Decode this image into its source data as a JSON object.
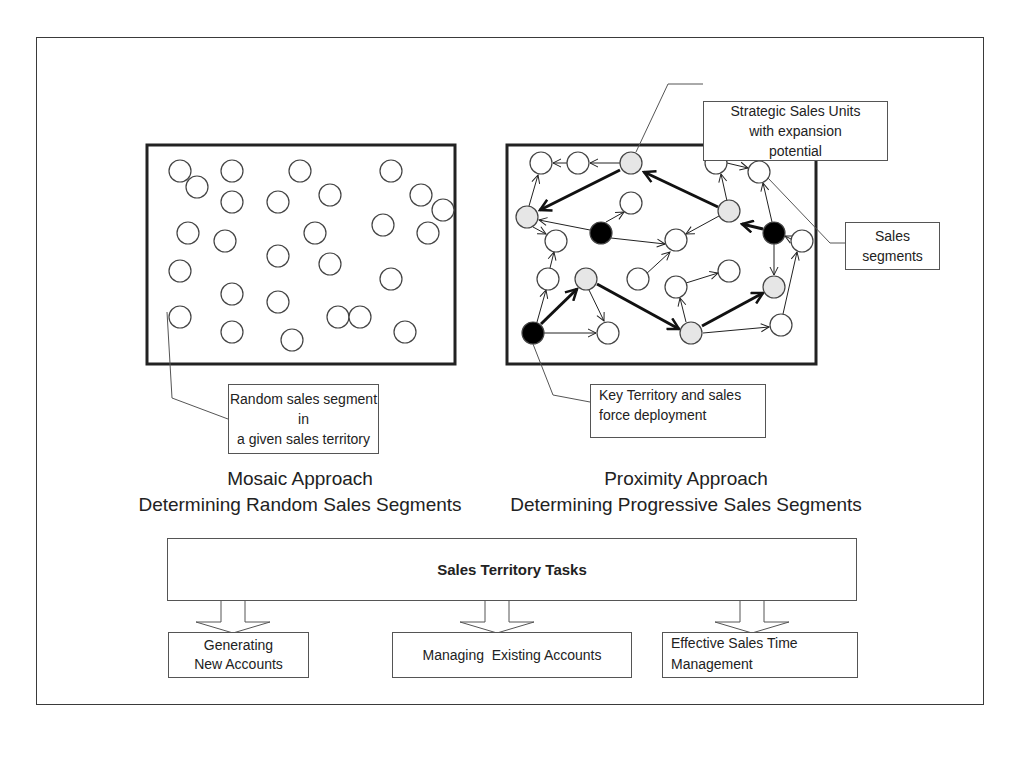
{
  "mosaic": {
    "callout": [
      "Random sales segment in",
      "a given sales territory"
    ],
    "caption_line1": "Mosaic Approach",
    "caption_line2": "Determining Random Sales Segments"
  },
  "proximity": {
    "callout_strategic": [
      "Strategic Sales Units",
      "with expansion",
      "potential"
    ],
    "callout_segments": [
      "Sales",
      "segments"
    ],
    "callout_key": [
      "Key Territory and sales",
      "force deployment"
    ],
    "caption_line1": "Proximity Approach",
    "caption_line2": "Determining Progressive Sales Segments"
  },
  "tasks": {
    "title": "Sales Territory Tasks",
    "items": [
      {
        "label_lines": [
          "Generating",
          "New Accounts"
        ]
      },
      {
        "label_lines": [
          "Managing  Existing Accounts"
        ]
      },
      {
        "label_lines": [
          "Effective Sales Time",
          "Management"
        ]
      }
    ]
  },
  "legend_colors": {
    "normal_segment": "#ffffff",
    "strategic_unit": "#e6e6e6",
    "key_territory": "#000000"
  }
}
